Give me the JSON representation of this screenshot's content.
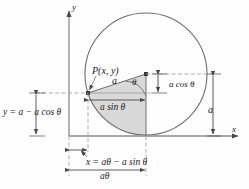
{
  "figure": {
    "axes": {
      "x_label": "x",
      "y_label": "y"
    },
    "labels": {
      "point_p": "P(x, y)",
      "radius_a": "a",
      "angle_theta": "θ",
      "a_cos_theta": "a cos θ",
      "a_sin_theta": "a sin θ",
      "right_radius_a": "a",
      "y_equation": "y = a − a cos θ",
      "x_equation": "x = aθ − a sin θ",
      "arc_length": "aθ"
    },
    "colors": {
      "stroke": "#6e6e6e",
      "axis": "#8a8a8a",
      "shaded_fill": "#d9d9d9",
      "text": "#1a1a1a",
      "background": "#fdfdfd"
    },
    "geometry": {
      "circle_center_x": 146,
      "circle_center_y": 74,
      "circle_radius": 61,
      "point_p_x": 88,
      "point_p_y": 93,
      "x_axis_y": 136,
      "y_axis_x": 69
    }
  }
}
